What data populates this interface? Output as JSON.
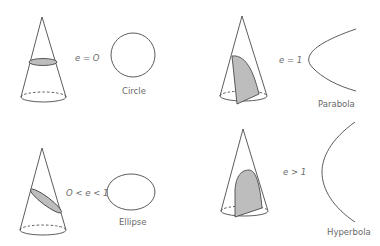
{
  "figure": {
    "panels": [
      {
        "id": "circle",
        "equation": "e = O",
        "name": "Circle"
      },
      {
        "id": "parabola",
        "equation": "e = 1",
        "name": "Parabola"
      },
      {
        "id": "ellipse",
        "equation": "O < e < 1",
        "name": "Ellipse"
      },
      {
        "id": "hyperbola",
        "equation": "e > 1",
        "name": "Hyperbola"
      }
    ]
  },
  "colors": {
    "line": "#4a4a4a",
    "slice_fill": "#bdbdbd",
    "text": "#6a6a6a",
    "background": "#ffffff"
  }
}
